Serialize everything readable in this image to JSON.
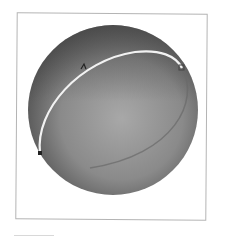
{
  "figure": {
    "type": "3d-sphere-with-curve",
    "sphere": {
      "center": [
        113,
        110
      ],
      "radius": 85,
      "highlight_color": "#a8a8a8",
      "shadow_color": "#505050"
    },
    "curve": {
      "color": "#f2f2f2",
      "description": "great-circle arc across sphere surface"
    },
    "markers": [
      {
        "id": "p1",
        "x": 83,
        "y": 67
      },
      {
        "id": "p2",
        "x": 182,
        "y": 68
      },
      {
        "id": "p3",
        "x": 40,
        "y": 153
      }
    ],
    "frame_color": "#b4b4b4"
  }
}
